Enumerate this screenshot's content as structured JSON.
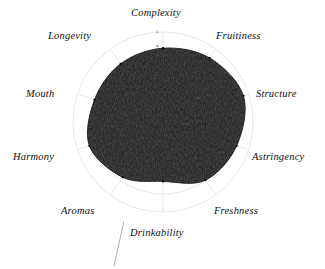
{
  "chart_data": {
    "type": "radar",
    "title": "",
    "subtitle": "",
    "xlabel": "",
    "ylabel": "",
    "grid": true,
    "grid_shape": "circular",
    "legend_position": "none",
    "rlim": [
      0,
      5
    ],
    "r_ticks": [
      "4",
      "5"
    ],
    "categories": [
      "Complexity",
      "Fruitiness",
      "Structure",
      "Astringency",
      "Freshness",
      "Drinkability",
      "Aromas",
      "Harmony",
      "Mouth",
      "Longevity"
    ],
    "series": [
      {
        "name": "Tasting profile",
        "values": [
          4.1,
          4.4,
          4.7,
          4.3,
          4.0,
          3.3,
          3.8,
          4.3,
          4.0,
          4.0
        ]
      }
    ],
    "colors": {
      "fill": "#1c1c1c",
      "stroke": "#000000",
      "grid": "#d9d9d9",
      "spoke": "#d9d9d9",
      "label": "#111111",
      "tick": "#555555",
      "background": "#ffffff"
    }
  },
  "labels": {
    "complexity": "Complexity",
    "fruitiness": "Fruitiness",
    "structure": "Structure",
    "astringency": "Astringency",
    "freshness": "Freshness",
    "drinkability": "Drinkability",
    "aromas": "Aromas",
    "harmony": "Harmony",
    "mouth": "Mouth",
    "longevity": "Longevity"
  },
  "ticks": {
    "outer": "5",
    "inner": "4"
  }
}
